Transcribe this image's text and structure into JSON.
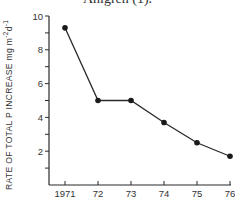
{
  "caption_fragment": "Ahlgren (1).",
  "chart_data": {
    "type": "line",
    "title": "",
    "xlabel": "",
    "ylabel": "RATE OF TOTAL P INCREASE mg m⁻²d⁻¹",
    "ylabel_parts": {
      "main": "RATE OF TOTAL P INCREASE  mg m",
      "exp1": "-2",
      "mid": "d",
      "exp2": "-1"
    },
    "categories": [
      "1971",
      "72",
      "73",
      "74",
      "75",
      "76"
    ],
    "series": [
      {
        "name": "Total P increase rate",
        "values": [
          9.3,
          5.0,
          5.0,
          3.7,
          2.5,
          1.7
        ]
      }
    ],
    "ylim": [
      0,
      10
    ],
    "yticks_major": [
      2,
      4,
      6,
      8,
      10
    ],
    "yticks_minor": [
      1,
      3,
      5,
      7,
      9
    ],
    "grid": false,
    "legend": "none",
    "marker": "filled-circle",
    "line_color": "#2a2a2a"
  }
}
